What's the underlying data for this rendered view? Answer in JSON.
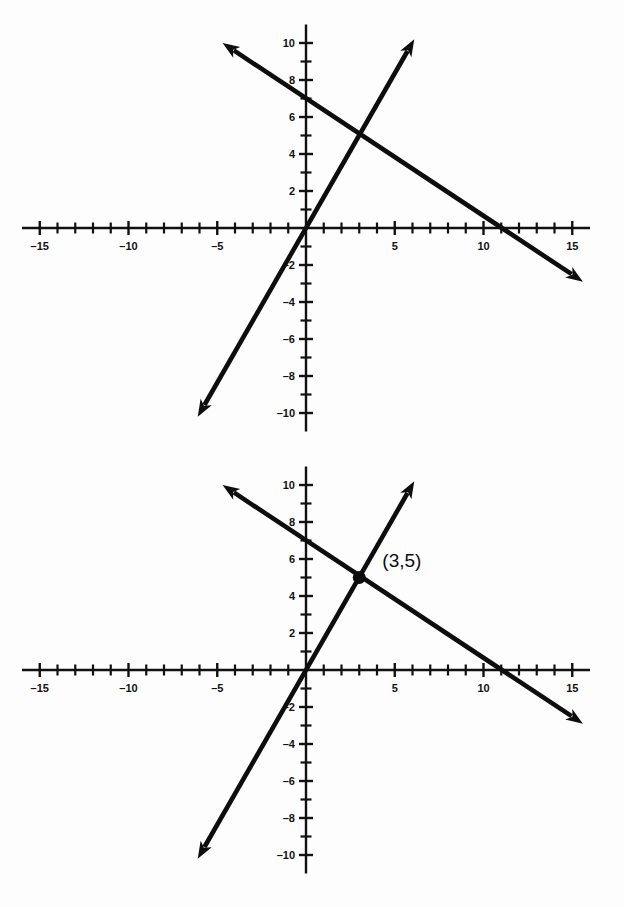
{
  "figure": {
    "background_color": "#fdfdfd",
    "ink_color": "#0d0d0d",
    "panel_count": 2
  },
  "chart_data": [
    {
      "id": "graph-top",
      "type": "line",
      "title": "",
      "subtitle": "",
      "xlabel": "",
      "ylabel": "",
      "xlim": [
        -16,
        16
      ],
      "ylim": [
        -11,
        11
      ],
      "grid": false,
      "legend": "none",
      "axis_style": "cartesian-cross",
      "x_tick_step": 1,
      "y_tick_step": 1,
      "x_label_step": 5,
      "y_label_step": 2,
      "x_tick_labels": [
        "-15",
        "-10",
        "-5",
        "5",
        "10",
        "15"
      ],
      "x_tick_label_values": [
        -15,
        -10,
        -5,
        5,
        10,
        15
      ],
      "y_tick_labels": [
        "10",
        "8",
        "6",
        "4",
        "2",
        "-2",
        "-4",
        "-6",
        "-8",
        "-10"
      ],
      "y_tick_label_values": [
        10,
        8,
        6,
        4,
        2,
        -2,
        -4,
        -6,
        -8,
        -10
      ],
      "series": [
        {
          "name": "descending-line",
          "slope": -0.6363636,
          "intercept": 7,
          "x_intercept": 11,
          "y_intercept": 7,
          "arrows": "both",
          "x": [
            -4.7,
            15.6
          ],
          "y": [
            10,
            -2.9
          ]
        },
        {
          "name": "ascending-line",
          "slope": 1.6666667,
          "intercept": 0,
          "x_intercept": 0,
          "y_intercept": 0,
          "arrows": "both",
          "x": [
            -6.1,
            6.1
          ],
          "y": [
            -10.2,
            10.2
          ]
        }
      ],
      "annotations": []
    },
    {
      "id": "graph-bottom",
      "type": "line",
      "title": "",
      "subtitle": "",
      "xlabel": "",
      "ylabel": "",
      "xlim": [
        -16,
        16
      ],
      "ylim": [
        -11,
        11
      ],
      "grid": false,
      "legend": "none",
      "axis_style": "cartesian-cross",
      "x_tick_step": 1,
      "y_tick_step": 1,
      "x_label_step": 5,
      "y_label_step": 2,
      "x_tick_labels": [
        "-15",
        "-10",
        "-5",
        "5",
        "10",
        "15"
      ],
      "x_tick_label_values": [
        -15,
        -10,
        -5,
        5,
        10,
        15
      ],
      "y_tick_labels": [
        "10",
        "8",
        "6",
        "4",
        "2",
        "-2",
        "-4",
        "-6",
        "-8",
        "-10"
      ],
      "y_tick_label_values": [
        10,
        8,
        6,
        4,
        2,
        -2,
        -4,
        -6,
        -8,
        -10
      ],
      "series": [
        {
          "name": "descending-line",
          "slope": -0.6363636,
          "intercept": 7,
          "x_intercept": 11,
          "y_intercept": 7,
          "arrows": "both",
          "x": [
            -4.7,
            15.6
          ],
          "y": [
            10,
            -2.9
          ]
        },
        {
          "name": "ascending-line",
          "slope": 1.6666667,
          "intercept": 0,
          "x_intercept": 0,
          "y_intercept": 0,
          "arrows": "both",
          "x": [
            -6.1,
            6.1
          ],
          "y": [
            -10.2,
            10.2
          ]
        }
      ],
      "annotations": [
        {
          "name": "intersection-point",
          "label": "(3,5)",
          "x": 3,
          "y": 5,
          "marker": "filled-circle",
          "label_offset_x": 1.3,
          "label_offset_y": 0.9
        }
      ]
    }
  ]
}
